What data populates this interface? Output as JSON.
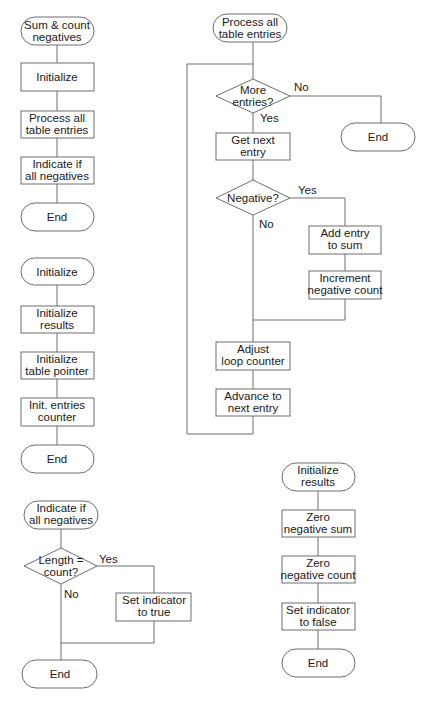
{
  "diagram": {
    "type": "flowchart",
    "charts": [
      {
        "id": "sum-count-negatives",
        "nodes": [
          {
            "id": "start",
            "shape": "terminal",
            "lines": [
              "Sum & count",
              "negatives"
            ]
          },
          {
            "id": "init",
            "shape": "process",
            "lines": [
              "Initialize"
            ]
          },
          {
            "id": "process",
            "shape": "process",
            "lines": [
              "Process all",
              "table entries"
            ]
          },
          {
            "id": "indicate",
            "shape": "process",
            "lines": [
              "Indicate if",
              "all negatives"
            ]
          },
          {
            "id": "end",
            "shape": "terminal",
            "lines": [
              "End"
            ]
          }
        ]
      },
      {
        "id": "initialize",
        "nodes": [
          {
            "id": "start",
            "shape": "terminal",
            "lines": [
              "Initialize"
            ]
          },
          {
            "id": "init-results",
            "shape": "process",
            "lines": [
              "Initialize",
              "results"
            ]
          },
          {
            "id": "init-pointer",
            "shape": "process",
            "lines": [
              "Initialize",
              "table pointer"
            ]
          },
          {
            "id": "init-counter",
            "shape": "process",
            "lines": [
              "Init. entries",
              "counter"
            ]
          },
          {
            "id": "end",
            "shape": "terminal",
            "lines": [
              "End"
            ]
          }
        ]
      },
      {
        "id": "indicate-if-all-negatives",
        "nodes": [
          {
            "id": "start",
            "shape": "terminal",
            "lines": [
              "Indicate if",
              "all negatives"
            ]
          },
          {
            "id": "decision",
            "shape": "decision",
            "lines": [
              "Length =",
              "count?"
            ]
          },
          {
            "id": "set-true",
            "shape": "process",
            "lines": [
              "Set indicator",
              "to true"
            ]
          },
          {
            "id": "end",
            "shape": "terminal",
            "lines": [
              "End"
            ]
          }
        ],
        "edge_labels": {
          "yes": "Yes",
          "no": "No"
        }
      },
      {
        "id": "process-all-table-entries",
        "nodes": [
          {
            "id": "start",
            "shape": "terminal",
            "lines": [
              "Process all",
              "table entries"
            ]
          },
          {
            "id": "more",
            "shape": "decision",
            "lines": [
              "More",
              "entries?"
            ]
          },
          {
            "id": "end",
            "shape": "terminal",
            "lines": [
              "End"
            ]
          },
          {
            "id": "get-next",
            "shape": "process",
            "lines": [
              "Get next",
              "entry"
            ]
          },
          {
            "id": "negative",
            "shape": "decision",
            "lines": [
              "Negative?"
            ]
          },
          {
            "id": "add-sum",
            "shape": "process",
            "lines": [
              "Add entry",
              "to sum"
            ]
          },
          {
            "id": "inc-count",
            "shape": "process",
            "lines": [
              "Increment",
              "negative count"
            ]
          },
          {
            "id": "adjust",
            "shape": "process",
            "lines": [
              "Adjust",
              "loop counter"
            ]
          },
          {
            "id": "advance",
            "shape": "process",
            "lines": [
              "Advance to",
              "next entry"
            ]
          }
        ],
        "edge_labels": {
          "more_no": "No",
          "more_yes": "Yes",
          "neg_yes": "Yes",
          "neg_no": "No"
        }
      },
      {
        "id": "initialize-results",
        "nodes": [
          {
            "id": "start",
            "shape": "terminal",
            "lines": [
              "Initialize",
              "results"
            ]
          },
          {
            "id": "zero-sum",
            "shape": "process",
            "lines": [
              "Zero",
              "negative sum"
            ]
          },
          {
            "id": "zero-count",
            "shape": "process",
            "lines": [
              "Zero",
              "negative count"
            ]
          },
          {
            "id": "set-false",
            "shape": "process",
            "lines": [
              "Set indicator",
              "to false"
            ]
          },
          {
            "id": "end",
            "shape": "terminal",
            "lines": [
              "End"
            ]
          }
        ]
      }
    ]
  }
}
